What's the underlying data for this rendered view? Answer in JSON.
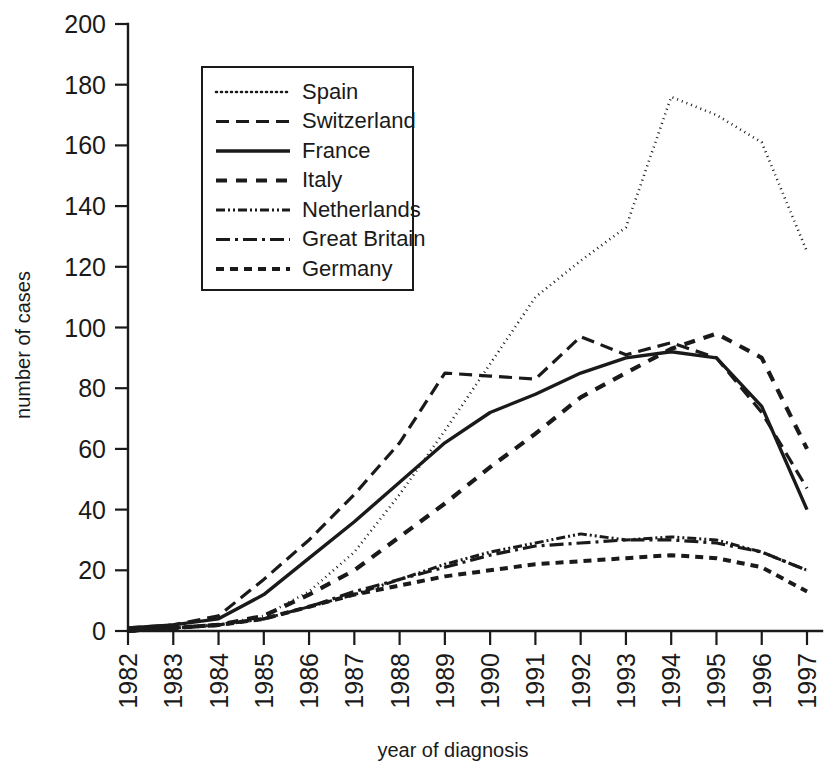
{
  "chart_data": {
    "type": "line",
    "title": "",
    "xlabel": "year of diagnosis",
    "ylabel": "number of cases",
    "x": [
      1982,
      1983,
      1984,
      1985,
      1986,
      1987,
      1988,
      1989,
      1990,
      1991,
      1992,
      1993,
      1994,
      1995,
      1996,
      1997
    ],
    "xtick_labels": [
      "1982",
      "1983",
      "1984",
      "1985",
      "1986",
      "1987",
      "1988",
      "1989",
      "1990",
      "1991",
      "1992",
      "1993",
      "1994",
      "1995",
      "1996",
      "1997"
    ],
    "ytick_labels": [
      "0",
      "20",
      "40",
      "60",
      "80",
      "100",
      "120",
      "140",
      "160",
      "180",
      "200"
    ],
    "ytick_values": [
      0,
      20,
      40,
      60,
      80,
      100,
      120,
      140,
      160,
      180,
      200
    ],
    "ylim": [
      0,
      200
    ],
    "xlim": [
      1982,
      1997
    ],
    "grid": false,
    "legend_position": "upper-left-inset",
    "series": [
      {
        "name": "Spain",
        "dash": "dotted",
        "stroke_width": 2.6,
        "dasharray": "1,4",
        "values": [
          0,
          1,
          2,
          5,
          13,
          26,
          45,
          66,
          88,
          110,
          122,
          133,
          176,
          170,
          161,
          125
        ]
      },
      {
        "name": "Switzerland",
        "dash": "long-dash",
        "stroke_width": 3.2,
        "dasharray": "13,7",
        "values": [
          1,
          2,
          5,
          17,
          30,
          45,
          62,
          85,
          84,
          83,
          97,
          91,
          95,
          90,
          72,
          47
        ]
      },
      {
        "name": "France",
        "dash": "solid",
        "stroke_width": 3.4,
        "dasharray": "",
        "values": [
          1,
          2,
          4,
          12,
          24,
          36,
          49,
          62,
          72,
          78,
          85,
          90,
          92,
          90,
          74,
          40
        ]
      },
      {
        "name": "Italy",
        "dash": "dashed",
        "stroke_width": 4.2,
        "dasharray": "11,9",
        "values": [
          0,
          1,
          2,
          5,
          12,
          20,
          31,
          42,
          54,
          65,
          77,
          85,
          93,
          98,
          90,
          60
        ]
      },
      {
        "name": "Netherlands",
        "dash": "dash-dot-dot",
        "stroke_width": 3.0,
        "dasharray": "9,3,2,3,2,3",
        "values": [
          0,
          1,
          2,
          4,
          8,
          12,
          17,
          22,
          26,
          29,
          32,
          30,
          31,
          30,
          26,
          20
        ]
      },
      {
        "name": "Great Britain",
        "dash": "dash-dot",
        "stroke_width": 3.2,
        "dasharray": "14,5,3,5",
        "values": [
          0,
          1,
          2,
          4,
          8,
          13,
          17,
          21,
          25,
          28,
          29,
          30,
          30,
          29,
          26,
          20
        ]
      },
      {
        "name": "Germany",
        "dash": "short-dash",
        "stroke_width": 4.0,
        "dasharray": "8,6",
        "values": [
          0,
          1,
          2,
          4,
          8,
          12,
          15,
          18,
          20,
          22,
          23,
          24,
          25,
          24,
          21,
          13
        ]
      }
    ]
  },
  "legend": {
    "items": [
      {
        "label": "Spain"
      },
      {
        "label": "Switzerland"
      },
      {
        "label": "France"
      },
      {
        "label": "Italy"
      },
      {
        "label": "Netherlands"
      },
      {
        "label": "Great Britain"
      },
      {
        "label": "Germany"
      }
    ]
  },
  "colors": {
    "ink": "#1a1a1a",
    "background": "#ffffff"
  }
}
